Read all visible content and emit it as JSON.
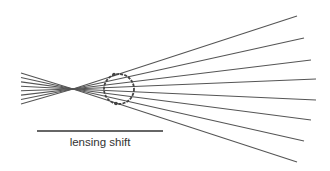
{
  "diagram": {
    "label": "lensing shift",
    "colors": {
      "rays": "#555555",
      "circle": "#444444",
      "scale_bar": "#333333",
      "text": "#333333"
    },
    "ray_count": 8
  }
}
